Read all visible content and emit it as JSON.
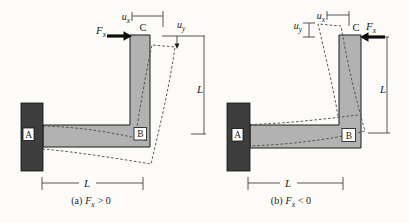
{
  "figure": {
    "colors": {
      "beam_fill": "#b2b2b2",
      "wall_fill": "#3e3e3e"
    },
    "panel_a": {
      "point_a": "A",
      "point_b": "B",
      "point_c": "C",
      "force_symbol": "F",
      "force_subscript": "x",
      "dim_ux_symbol": "u",
      "dim_ux_subscript": "x",
      "dim_uy_symbol": "u",
      "dim_uy_subscript": "y",
      "dim_length_vertical": "L",
      "dim_length_horizontal": "L",
      "caption_prefix": "(a)",
      "caption_force_symbol": "F",
      "caption_force_subscript": "x",
      "caption_relation": "> 0"
    },
    "panel_b": {
      "point_a": "A",
      "point_b": "B",
      "point_c": "C",
      "force_symbol": "F",
      "force_subscript": "x",
      "dim_ux_symbol": "u",
      "dim_ux_subscript": "x",
      "dim_uy_symbol": "u",
      "dim_uy_subscript": "y",
      "dim_length_vertical": "L",
      "dim_length_horizontal": "L",
      "caption_prefix": "(b)",
      "caption_force_symbol": "F",
      "caption_force_subscript": "x",
      "caption_relation": "< 0"
    }
  }
}
